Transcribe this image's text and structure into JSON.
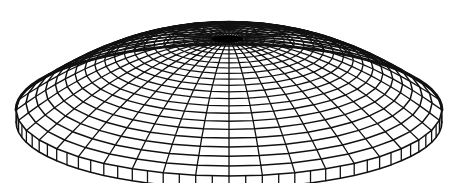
{
  "figure": {
    "canvas": {
      "width": 456,
      "height": 183,
      "background": "#ffffff"
    },
    "colors": {
      "stroke": "#111111",
      "apex_fill": "#000000"
    },
    "geometry": {
      "base_center": [
        229,
        110
      ],
      "base_radius_x": 213,
      "base_radius_y": 66,
      "rim_height": 12,
      "apex_center": [
        228,
        39
      ],
      "apex_radius_x": 16,
      "apex_radius_y": 4,
      "meridians": 40,
      "rings": 20,
      "stroke_width": 1.3
    }
  }
}
